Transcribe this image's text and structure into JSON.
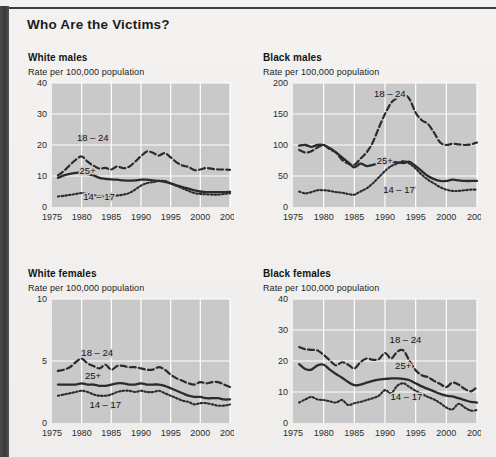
{
  "header": {
    "title": "Who Are the Victims?"
  },
  "common": {
    "subtitle": "Rate per 100,000 population",
    "series_labels": {
      "young": "18 – 24",
      "adult": "25+",
      "teen": "14 – 17"
    },
    "xticks": [
      "1975",
      "1980",
      "1985",
      "1990",
      "1995",
      "2000",
      "2005"
    ],
    "colors": {
      "plot_bg": "#c9c9c9",
      "grid": "#ffffff",
      "ink": "#2b2b2b",
      "page_bg": "#f2f1ef",
      "gutter": "#444444"
    }
  },
  "chart_data": [
    {
      "id": "white-males",
      "type": "line",
      "title": "White males",
      "subtitle": "Rate per 100,000 population",
      "xlabel": "",
      "ylabel": "Rate per 100,000 population",
      "xlim": [
        1975,
        2005
      ],
      "ylim": [
        0,
        40
      ],
      "yticks": [
        0,
        10,
        20,
        30,
        40
      ],
      "xticks": [
        1975,
        1980,
        1985,
        1990,
        1995,
        2000,
        2005
      ],
      "grid": true,
      "x": [
        1976,
        1977,
        1978,
        1979,
        1980,
        1981,
        1982,
        1983,
        1984,
        1985,
        1986,
        1987,
        1988,
        1989,
        1990,
        1991,
        1992,
        1993,
        1994,
        1995,
        1996,
        1997,
        1998,
        1999,
        2000,
        2001,
        2002,
        2003,
        2004,
        2005
      ],
      "series": [
        {
          "name": "18 – 24",
          "style": "dashed",
          "annotation": "18 – 24",
          "values": [
            10.2,
            11.6,
            13.5,
            15.2,
            16.3,
            14.6,
            13.3,
            12.4,
            12.6,
            12.1,
            13.1,
            12.5,
            13.0,
            14.6,
            16.4,
            17.9,
            17.5,
            16.6,
            17.4,
            16.0,
            14.4,
            13.4,
            12.9,
            11.9,
            12.1,
            12.6,
            12.3,
            12.1,
            12.1,
            12.0
          ]
        },
        {
          "name": "25+",
          "style": "solid",
          "annotation": "25+",
          "values": [
            9.4,
            10.2,
            10.7,
            11.0,
            11.1,
            10.6,
            10.2,
            9.4,
            9.1,
            8.9,
            8.8,
            8.6,
            8.5,
            8.6,
            8.8,
            8.8,
            8.6,
            8.4,
            8.1,
            7.6,
            7.0,
            6.4,
            5.9,
            5.4,
            5.0,
            4.8,
            4.8,
            4.8,
            4.8,
            4.9
          ]
        },
        {
          "name": "14 – 17",
          "style": "dotted",
          "annotation": "14 – 17",
          "values": [
            3.4,
            3.6,
            3.9,
            4.2,
            4.5,
            4.2,
            3.8,
            3.5,
            3.4,
            3.5,
            3.7,
            4.0,
            4.5,
            5.6,
            6.9,
            7.7,
            8.0,
            8.4,
            8.4,
            7.6,
            6.8,
            6.0,
            5.2,
            4.5,
            4.2,
            4.1,
            4.0,
            4.0,
            4.2,
            4.4
          ]
        }
      ]
    },
    {
      "id": "black-males",
      "type": "line",
      "title": "Black males",
      "subtitle": "Rate per 100,000 population",
      "xlabel": "",
      "ylabel": "Rate per 100,000 population",
      "xlim": [
        1975,
        2005
      ],
      "ylim": [
        0,
        200
      ],
      "yticks": [
        0,
        50,
        100,
        150,
        200
      ],
      "xticks": [
        1975,
        1980,
        1985,
        1990,
        1995,
        2000,
        2005
      ],
      "grid": true,
      "x": [
        1976,
        1977,
        1978,
        1979,
        1980,
        1981,
        1982,
        1983,
        1984,
        1985,
        1986,
        1987,
        1988,
        1989,
        1990,
        1991,
        1992,
        1993,
        1994,
        1995,
        1996,
        1997,
        1998,
        1999,
        2000,
        2001,
        2002,
        2003,
        2004,
        2005
      ],
      "series": [
        {
          "name": "18 – 24",
          "style": "dashed",
          "annotation": "18 – 24",
          "values": [
            92,
            88,
            90,
            96,
            100,
            93,
            88,
            76,
            70,
            68,
            78,
            88,
            104,
            128,
            150,
            168,
            176,
            182,
            174,
            152,
            140,
            134,
            120,
            104,
            100,
            102,
            101,
            100,
            101,
            104
          ]
        },
        {
          "name": "25+",
          "style": "solid",
          "annotation": "25+",
          "values": [
            99,
            100,
            97,
            100,
            100,
            95,
            88,
            80,
            72,
            64,
            70,
            66,
            68,
            70,
            72,
            73,
            72,
            71,
            73,
            66,
            58,
            50,
            45,
            42,
            42,
            44,
            43,
            42,
            42,
            42
          ]
        },
        {
          "name": "14 – 17",
          "style": "dotted",
          "annotation": "14 – 17",
          "values": [
            25,
            22,
            24,
            27,
            27,
            26,
            24,
            23,
            21,
            20,
            25,
            30,
            38,
            48,
            58,
            66,
            70,
            74,
            70,
            62,
            52,
            44,
            38,
            32,
            28,
            26,
            26,
            27,
            28,
            28
          ]
        }
      ]
    },
    {
      "id": "white-females",
      "type": "line",
      "title": "White females",
      "subtitle": "Rate per 100,000 population",
      "xlabel": "",
      "ylabel": "Rate per 100,000 population",
      "xlim": [
        1975,
        2005
      ],
      "ylim": [
        0,
        10
      ],
      "yticks": [
        0,
        5,
        10
      ],
      "xticks": [
        1975,
        1980,
        1985,
        1990,
        1995,
        2000,
        2005
      ],
      "grid": true,
      "x": [
        1976,
        1977,
        1978,
        1979,
        1980,
        1981,
        1982,
        1983,
        1984,
        1985,
        1986,
        1987,
        1988,
        1989,
        1990,
        1991,
        1992,
        1993,
        1994,
        1995,
        1996,
        1997,
        1998,
        1999,
        2000,
        2001,
        2002,
        2003,
        2004,
        2005
      ],
      "series": [
        {
          "name": "18 – 24",
          "style": "dashed",
          "annotation": "18 – 24",
          "values": [
            4.2,
            4.3,
            4.5,
            4.9,
            5.2,
            4.8,
            4.6,
            4.4,
            4.7,
            4.3,
            4.6,
            4.6,
            4.5,
            4.5,
            4.4,
            4.3,
            4.3,
            4.5,
            4.3,
            3.9,
            3.6,
            3.4,
            3.2,
            3.1,
            3.3,
            3.2,
            3.3,
            3.3,
            3.1,
            2.9
          ]
        },
        {
          "name": "25+",
          "style": "solid",
          "annotation": "25+",
          "values": [
            3.1,
            3.1,
            3.1,
            3.1,
            3.2,
            3.1,
            3.1,
            3.0,
            3.0,
            3.1,
            3.2,
            3.2,
            3.1,
            3.1,
            3.2,
            3.1,
            3.1,
            3.1,
            3.0,
            2.8,
            2.6,
            2.4,
            2.2,
            2.1,
            2.1,
            2.0,
            2.0,
            2.0,
            1.9,
            1.9
          ]
        },
        {
          "name": "14 – 17",
          "style": "dotted",
          "annotation": "14 – 17",
          "values": [
            2.2,
            2.3,
            2.4,
            2.5,
            2.6,
            2.5,
            2.3,
            2.2,
            2.2,
            2.3,
            2.5,
            2.6,
            2.6,
            2.5,
            2.6,
            2.5,
            2.5,
            2.6,
            2.4,
            2.2,
            2.0,
            1.8,
            1.7,
            1.5,
            1.6,
            1.6,
            1.5,
            1.4,
            1.4,
            1.5
          ]
        }
      ]
    },
    {
      "id": "black-females",
      "type": "line",
      "title": "Black females",
      "subtitle": "Rate per 100,000 population",
      "xlabel": "",
      "ylabel": "Rate per 100,000 population",
      "xlim": [
        1975,
        2005
      ],
      "ylim": [
        0,
        40
      ],
      "yticks": [
        0,
        10,
        20,
        30,
        40
      ],
      "xticks": [
        1975,
        1980,
        1985,
        1990,
        1995,
        2000,
        2005
      ],
      "grid": true,
      "x": [
        1976,
        1977,
        1978,
        1979,
        1980,
        1981,
        1982,
        1983,
        1984,
        1985,
        1986,
        1987,
        1988,
        1989,
        1990,
        1991,
        1992,
        1993,
        1994,
        1995,
        1996,
        1997,
        1998,
        1999,
        2000,
        2001,
        2002,
        2003,
        2004,
        2005
      ],
      "series": [
        {
          "name": "18 – 24",
          "style": "dashed",
          "annotation": "18 – 24",
          "values": [
            24.5,
            23.8,
            23.6,
            23.4,
            22.0,
            20.2,
            18.6,
            19.6,
            18.8,
            17.6,
            19.6,
            20.8,
            20.4,
            20.6,
            22.6,
            20.8,
            23.0,
            23.4,
            20.0,
            17.0,
            15.4,
            14.8,
            13.6,
            12.6,
            11.6,
            13.0,
            12.4,
            11.0,
            10.2,
            11.6
          ]
        },
        {
          "name": "25+",
          "style": "solid",
          "annotation": "25+",
          "values": [
            19.0,
            17.4,
            17.2,
            18.6,
            18.8,
            17.2,
            15.8,
            14.6,
            13.2,
            12.2,
            12.4,
            13.0,
            13.6,
            14.0,
            14.2,
            14.4,
            14.4,
            14.2,
            13.8,
            12.8,
            11.8,
            11.0,
            10.2,
            9.4,
            8.8,
            8.6,
            8.0,
            7.4,
            6.8,
            6.6
          ]
        },
        {
          "name": "14 – 17",
          "style": "dotted",
          "annotation": "14 – 17",
          "values": [
            6.6,
            7.6,
            8.4,
            7.6,
            7.4,
            7.0,
            6.6,
            7.4,
            5.8,
            6.4,
            6.8,
            7.4,
            8.0,
            8.8,
            10.6,
            9.6,
            12.0,
            12.8,
            11.6,
            10.4,
            9.4,
            8.4,
            7.6,
            6.4,
            5.0,
            4.4,
            6.2,
            5.0,
            4.0,
            4.2
          ]
        }
      ]
    }
  ]
}
